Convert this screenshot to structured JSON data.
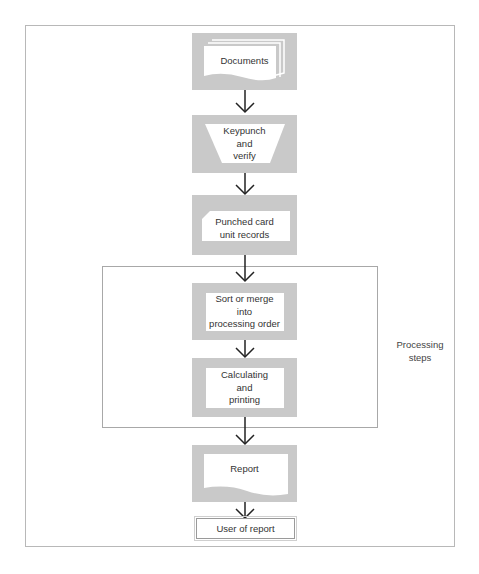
{
  "diagram": {
    "type": "flowchart",
    "colors": {
      "box_fill": "#c9c9c9",
      "inner_fill": "#ffffff",
      "line": "#333333",
      "border": "#b8b8b8"
    },
    "nodes": [
      {
        "id": "documents",
        "shape": "document-stack",
        "label": "Documents"
      },
      {
        "id": "keypunch",
        "shape": "manual-operation-trapezoid",
        "label_lines": [
          "Keypunch",
          "and",
          "verify"
        ]
      },
      {
        "id": "punched-card",
        "shape": "punched-card",
        "label_lines": [
          "Punched card",
          "unit records"
        ]
      },
      {
        "id": "sort",
        "shape": "process",
        "label_lines": [
          "Sort or merge",
          "into",
          "processing order"
        ]
      },
      {
        "id": "calculating",
        "shape": "process",
        "label_lines": [
          "Calculating",
          "and",
          "printing"
        ]
      },
      {
        "id": "report",
        "shape": "document",
        "label": "Report"
      },
      {
        "id": "user",
        "shape": "terminal-box",
        "label": "User of report"
      }
    ],
    "edges": [
      [
        "documents",
        "keypunch"
      ],
      [
        "keypunch",
        "punched-card"
      ],
      [
        "punched-card",
        "sort"
      ],
      [
        "sort",
        "calculating"
      ],
      [
        "calculating",
        "report"
      ],
      [
        "report",
        "user"
      ]
    ],
    "group": {
      "label_lines": [
        "Processing",
        "steps"
      ],
      "contains": [
        "sort",
        "calculating"
      ]
    }
  }
}
